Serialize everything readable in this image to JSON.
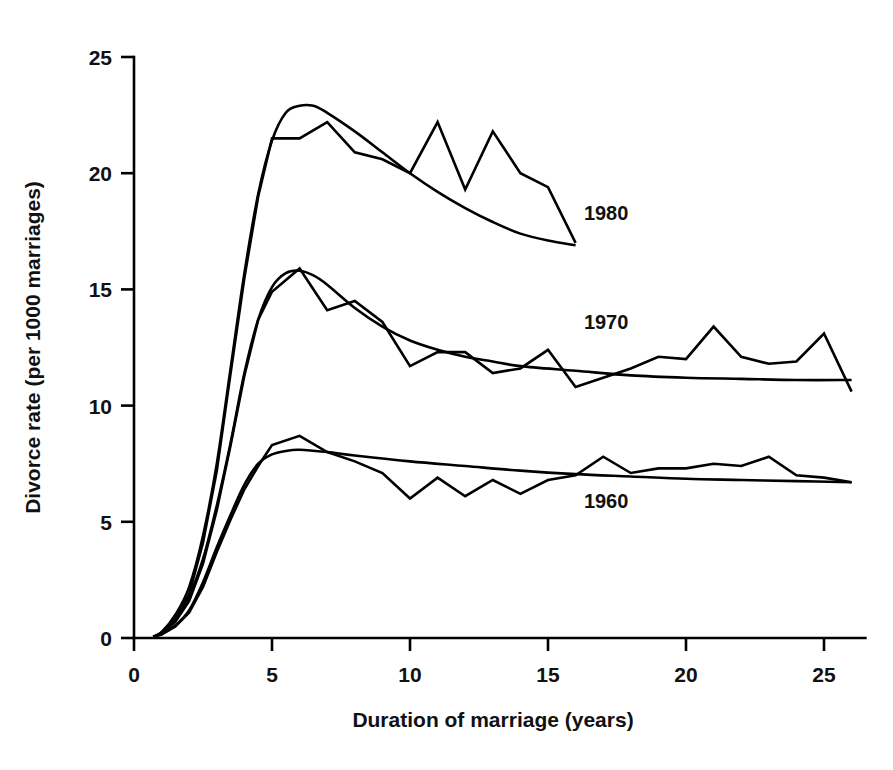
{
  "chart_data": {
    "type": "line",
    "title": "",
    "xlabel": "Duration of marriage (years)",
    "ylabel": "Divorce rate (per 1000 marriages)",
    "xlim": [
      0,
      26.5
    ],
    "ylim": [
      0,
      25
    ],
    "xticks": [
      0,
      5,
      10,
      15,
      20,
      25
    ],
    "xtick_labels": [
      "0",
      "5",
      "10",
      "15",
      "20",
      "25"
    ],
    "yticks": [
      0,
      5,
      10,
      15,
      20,
      25
    ],
    "ytick_labels": [
      "0",
      "5",
      "10",
      "15",
      "20",
      "25"
    ],
    "grid": false,
    "legend": "inline-labels",
    "legend_position": "right-of-curves",
    "series": [
      {
        "name": "1980",
        "label": "1980",
        "label_x": 16.3,
        "label_y": 18.3,
        "observed": {
          "x": [
            0.7,
            1.0,
            1.5,
            2.0,
            2.5,
            3.0,
            3.5,
            4.0,
            4.5,
            5.0,
            6.0,
            7.0,
            8.0,
            9.0,
            10.0,
            11.0,
            12.0,
            13.0,
            14.0,
            15.0,
            16.0
          ],
          "y": [
            0.05,
            0.2,
            0.8,
            1.9,
            4.1,
            7.2,
            11.4,
            15.5,
            19.0,
            21.5,
            21.5,
            22.2,
            20.9,
            20.6,
            20.0,
            22.2,
            19.3,
            21.8,
            20.0,
            19.4,
            17.0
          ]
        },
        "smooth": {
          "x": [
            0.7,
            1.0,
            1.5,
            2.0,
            2.5,
            3.0,
            3.5,
            4.0,
            4.5,
            5.0,
            5.5,
            6.0,
            6.5,
            7.0,
            8.0,
            9.0,
            10.0,
            11.0,
            12.0,
            13.0,
            14.0,
            15.0,
            16.0
          ],
          "y": [
            0.05,
            0.25,
            1.0,
            2.2,
            4.4,
            7.5,
            11.6,
            15.7,
            19.1,
            21.4,
            22.6,
            22.9,
            22.9,
            22.6,
            21.8,
            20.9,
            20.0,
            19.2,
            18.5,
            17.9,
            17.4,
            17.1,
            16.9
          ]
        }
      },
      {
        "name": "1970",
        "label": "1970",
        "label_x": 16.3,
        "label_y": 13.6,
        "observed": {
          "x": [
            0.7,
            1.0,
            1.5,
            2.0,
            2.5,
            3.0,
            3.5,
            4.0,
            4.5,
            5.0,
            6.0,
            7.0,
            8.0,
            9.0,
            10.0,
            11.0,
            12.0,
            13.0,
            14.0,
            15.0,
            16.0,
            17.0,
            18.0,
            19.0,
            20.0,
            21.0,
            22.0,
            23.0,
            24.0,
            25.0,
            26.0
          ],
          "y": [
            0.05,
            0.2,
            0.7,
            1.6,
            3.2,
            5.5,
            8.3,
            11.3,
            13.7,
            14.9,
            15.9,
            14.1,
            14.5,
            13.6,
            11.7,
            12.3,
            12.3,
            11.4,
            11.6,
            12.4,
            10.8,
            11.2,
            11.6,
            12.1,
            12.0,
            13.4,
            12.1,
            11.8,
            11.9,
            13.1,
            10.6
          ]
        },
        "smooth": {
          "x": [
            0.7,
            1.0,
            1.5,
            2.0,
            2.5,
            3.0,
            3.5,
            4.0,
            4.5,
            5.0,
            5.5,
            6.0,
            6.5,
            7.0,
            8.0,
            9.0,
            10.0,
            11.0,
            12.0,
            13.0,
            14.0,
            16.0,
            18.0,
            20.0,
            22.0,
            24.0,
            26.0
          ],
          "y": [
            0.05,
            0.25,
            0.8,
            1.8,
            3.4,
            5.7,
            8.4,
            11.4,
            13.7,
            15.1,
            15.7,
            15.8,
            15.6,
            15.2,
            14.2,
            13.4,
            12.8,
            12.4,
            12.1,
            11.9,
            11.7,
            11.5,
            11.3,
            11.2,
            11.15,
            11.1,
            11.1
          ]
        }
      },
      {
        "name": "1960",
        "label": "1960",
        "label_x": 16.3,
        "label_y": 5.9,
        "observed": {
          "x": [
            0.7,
            1.0,
            1.5,
            2.0,
            2.5,
            3.0,
            3.5,
            4.0,
            4.5,
            5.0,
            6.0,
            7.0,
            8.0,
            9.0,
            10.0,
            11.0,
            12.0,
            13.0,
            14.0,
            15.0,
            16.0,
            17.0,
            18.0,
            19.0,
            20.0,
            21.0,
            22.0,
            23.0,
            24.0,
            25.0,
            26.0
          ],
          "y": [
            0.05,
            0.15,
            0.5,
            1.1,
            2.2,
            3.7,
            5.1,
            6.4,
            7.4,
            8.3,
            8.7,
            8.0,
            7.6,
            7.1,
            6.0,
            6.9,
            6.1,
            6.8,
            6.2,
            6.8,
            7.0,
            7.8,
            7.1,
            7.3,
            7.3,
            7.5,
            7.4,
            7.8,
            7.0,
            6.9,
            6.7
          ]
        },
        "smooth": {
          "x": [
            0.7,
            1.0,
            1.5,
            2.0,
            2.5,
            3.0,
            3.5,
            4.0,
            4.5,
            5.0,
            5.5,
            6.0,
            7.0,
            8.0,
            10.0,
            12.0,
            14.0,
            16.0,
            18.0,
            20.0,
            22.0,
            24.0,
            26.0
          ],
          "y": [
            0.05,
            0.2,
            0.55,
            1.2,
            2.4,
            3.9,
            5.3,
            6.6,
            7.5,
            7.9,
            8.05,
            8.1,
            8.0,
            7.85,
            7.6,
            7.4,
            7.2,
            7.05,
            6.95,
            6.85,
            6.8,
            6.75,
            6.7
          ]
        }
      }
    ]
  }
}
